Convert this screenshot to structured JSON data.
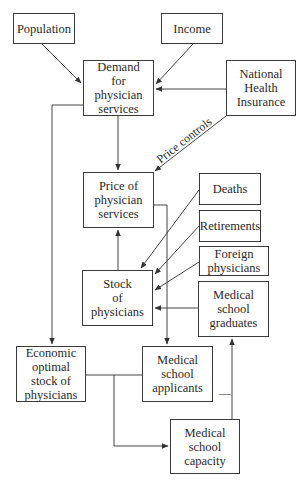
{
  "diagram": {
    "title": "",
    "nodes": [
      {
        "id": "population",
        "label": "Population",
        "x": 13,
        "y": 13,
        "w": 62,
        "h": 31
      },
      {
        "id": "income",
        "label": "Income",
        "x": 161,
        "y": 13,
        "w": 62,
        "h": 31
      },
      {
        "id": "demand",
        "label": "Demand\nfor\nphysician\nservices",
        "x": 83,
        "y": 60,
        "w": 71,
        "h": 56
      },
      {
        "id": "nhi",
        "label": "National\nHealth\nInsurance",
        "x": 226,
        "y": 60,
        "w": 70,
        "h": 56
      },
      {
        "id": "price",
        "label": "Price of\nphysician\nservices",
        "x": 83,
        "y": 172,
        "w": 71,
        "h": 56
      },
      {
        "id": "deaths",
        "label": "Deaths",
        "x": 199,
        "y": 173,
        "w": 62,
        "h": 32
      },
      {
        "id": "retirements",
        "label": "Retirements",
        "x": 199,
        "y": 210,
        "w": 62,
        "h": 32
      },
      {
        "id": "foreign",
        "label": "Foreign\nphysicians",
        "x": 199,
        "y": 246,
        "w": 70,
        "h": 30
      },
      {
        "id": "stock",
        "label": "Stock\nof\nphysicians",
        "x": 82,
        "y": 270,
        "w": 71,
        "h": 56
      },
      {
        "id": "graduates",
        "label": "Medical\nschool\ngraduates",
        "x": 198,
        "y": 281,
        "w": 71,
        "h": 56
      },
      {
        "id": "economic",
        "label": "Economic\noptimal\nstock of\nphysicians",
        "x": 16,
        "y": 346,
        "w": 70,
        "h": 56
      },
      {
        "id": "applicants",
        "label": "Medical\nschool\napplicants",
        "x": 142,
        "y": 346,
        "w": 71,
        "h": 56
      },
      {
        "id": "capacity",
        "label": "Medical\nschool\ncapacity",
        "x": 170,
        "y": 419,
        "w": 70,
        "h": 55
      }
    ],
    "edges": [
      {
        "from": "population",
        "to": "demand"
      },
      {
        "from": "income",
        "to": "demand"
      },
      {
        "from": "nhi",
        "to": "demand"
      },
      {
        "from": "nhi",
        "to": "price",
        "label": "Price controls"
      },
      {
        "from": "demand",
        "to": "price"
      },
      {
        "from": "demand",
        "to": "economic"
      },
      {
        "from": "stock",
        "to": "price"
      },
      {
        "from": "price",
        "to": "applicants"
      },
      {
        "from": "deaths",
        "to": "stock"
      },
      {
        "from": "retirements",
        "to": "stock"
      },
      {
        "from": "foreign",
        "to": "stock"
      },
      {
        "from": "graduates",
        "to": "stock"
      },
      {
        "from": "economic",
        "to": "applicants"
      },
      {
        "from": "economic",
        "to": "capacity"
      },
      {
        "from": "capacity",
        "to": "graduates",
        "sign": "—"
      }
    ],
    "edge_label_price_controls": "Price controls",
    "minus_sign": "—"
  }
}
